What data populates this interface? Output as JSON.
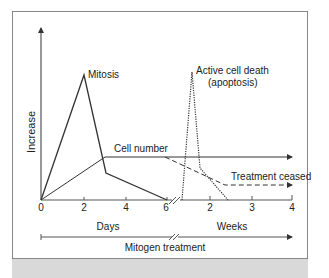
{
  "figure": {
    "y_axis_label": "Increase",
    "labels": {
      "mitosis": "Mitosis",
      "apoptosis_line1": "Active cell death",
      "apoptosis_line2": "(apoptosis)",
      "cell_number": "Cell number",
      "treatment_ceased": "Treatment ceased"
    },
    "x_ticks_days": [
      "0",
      "2",
      "4",
      "6"
    ],
    "x_ticks_weeks": [
      "2",
      "3",
      "4"
    ],
    "days_label": "Days",
    "weeks_label": "Weeks",
    "treatment_label": "Mitogen treatment"
  },
  "colors": {
    "line": "#333333",
    "frame": "#888888",
    "footer_strip": "#d9d9d9"
  }
}
